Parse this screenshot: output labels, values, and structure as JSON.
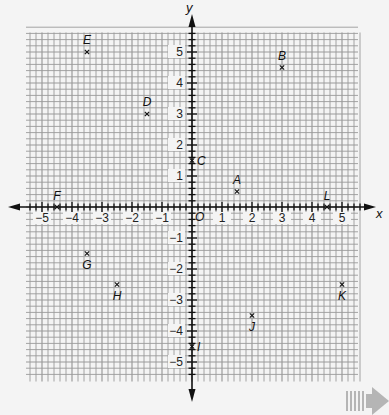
{
  "chart_data": {
    "type": "scatter",
    "title": "",
    "xlabel": "x",
    "ylabel": "y",
    "origin_label": "O",
    "xlim": [
      -5.5,
      5.5
    ],
    "ylim": [
      -5.5,
      5.5
    ],
    "grid": true,
    "grid_subdivisions": 5,
    "x_ticks": [
      -5,
      -4,
      -3,
      -2,
      -1,
      1,
      2,
      3,
      4,
      5
    ],
    "y_ticks": [
      -5,
      -4,
      -3,
      -2,
      -1,
      1,
      2,
      3,
      4,
      5
    ],
    "x_tick_labels": [
      "−5",
      "−4",
      "−3",
      "−2",
      "−1",
      "1",
      "2",
      "3",
      "4",
      "5"
    ],
    "y_tick_labels": [
      "−5",
      "−4",
      "−3",
      "−2",
      "−1",
      "1",
      "2",
      "3",
      "4",
      "5"
    ],
    "points": [
      {
        "label": "A",
        "x": 1.5,
        "y": 0.5
      },
      {
        "label": "B",
        "x": 3,
        "y": 4.5
      },
      {
        "label": "C",
        "x": 0,
        "y": 1.5
      },
      {
        "label": "D",
        "x": -1.5,
        "y": 3
      },
      {
        "label": "E",
        "x": -3.5,
        "y": 5
      },
      {
        "label": "F",
        "x": -4.5,
        "y": 0
      },
      {
        "label": "G",
        "x": -3.5,
        "y": -1.5
      },
      {
        "label": "H",
        "x": -2.5,
        "y": -2.5
      },
      {
        "label": "I",
        "x": 0,
        "y": -4.5
      },
      {
        "label": "J",
        "x": 2,
        "y": -3.5
      },
      {
        "label": "K",
        "x": 5,
        "y": -2.5
      },
      {
        "label": "L",
        "x": 4.5,
        "y": 0
      }
    ]
  },
  "colors": {
    "background": "#f4f4f4",
    "grid": "#9a9a9a",
    "axis": "#111111",
    "next_arrow": "#b5b5b5"
  },
  "next_arrow_icon": "next-page-arrow-icon"
}
